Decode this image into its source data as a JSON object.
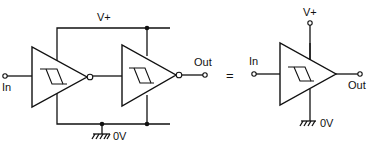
{
  "diagram": {
    "type": "circuit-schematic",
    "left_circuit": {
      "supply_label": "V+",
      "ground_label": "0V",
      "input_label": "In",
      "output_label": "Out",
      "stages": [
        {
          "name": "schmitt-inverter-1",
          "symbol": "hysteresis",
          "output": "inverted"
        },
        {
          "name": "schmitt-inverter-2",
          "symbol": "hysteresis",
          "output": "inverted"
        }
      ]
    },
    "equals_sign": "=",
    "right_circuit": {
      "supply_label": "V+",
      "ground_label": "0V",
      "input_label": "In",
      "output_label": "Out",
      "stages": [
        {
          "name": "schmitt-buffer",
          "symbol": "hysteresis",
          "output": "non-inverted"
        }
      ]
    },
    "colors": {
      "line": "#111111",
      "background": "#ffffff"
    }
  }
}
